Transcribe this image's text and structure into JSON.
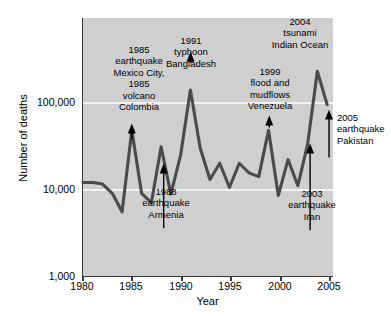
{
  "figure": {
    "background_color": "#ffffff",
    "plot_background_color": "#cfcfcf",
    "line_color": "#4a4a4a",
    "gridline_color": "#f2f2f2",
    "axis_color": "#3a3a3a"
  },
  "chart_data": {
    "type": "line",
    "title": "",
    "xlabel": "Year",
    "ylabel": "Number of deaths",
    "xlim": [
      1980,
      2005.6
    ],
    "ylim": [
      1000,
      1000000
    ],
    "yscale": "log",
    "grid": true,
    "legend": null,
    "xticks": [
      "1980",
      "1985",
      "1990",
      "1995",
      "2000",
      "2005"
    ],
    "xtick_values": [
      1980,
      1985,
      1990,
      1995,
      2000,
      2005
    ],
    "yticks": [
      "1,000",
      "10,000",
      "100,000"
    ],
    "ytick_values": [
      1000,
      10000,
      100000
    ],
    "x": [
      1980,
      1981,
      1982,
      1983,
      1984,
      1985,
      1986,
      1987,
      1988,
      1989,
      1990,
      1991,
      1992,
      1993,
      1994,
      1995,
      1996,
      1997,
      1998,
      1999,
      2000,
      2001,
      2002,
      2003,
      2004,
      2005
    ],
    "values": [
      12000,
      12000,
      11500,
      9000,
      5500,
      48000,
      9000,
      7000,
      31000,
      8800,
      25000,
      140000,
      30000,
      13000,
      20000,
      10500,
      20000,
      15500,
      14000,
      48000,
      8500,
      22000,
      11000,
      33000,
      230000,
      95000
    ],
    "annotations": [
      {
        "id": "mexico-colombia",
        "lines": [
          "1985",
          "earthquake",
          "Mexico City,",
          "1985",
          "volcano",
          "Colombia"
        ],
        "points_to_year": 1985
      },
      {
        "id": "bangladesh",
        "lines": [
          "1991",
          "typhoon",
          "Bangladesh"
        ],
        "points_to_year": 1991
      },
      {
        "id": "venezuela",
        "lines": [
          "1999",
          "flood and",
          "mudflows",
          "Venezuela"
        ],
        "points_to_year": 1999
      },
      {
        "id": "indian-ocean",
        "lines": [
          "2004",
          "tsunami",
          "Indian Ocean"
        ],
        "points_to_year": 2004
      },
      {
        "id": "armenia",
        "lines": [
          "1988",
          "earthquake",
          "Armenia"
        ],
        "points_to_year": 1988
      },
      {
        "id": "iran",
        "lines": [
          "2003",
          "earthquake",
          "Iran"
        ],
        "points_to_year": 2003
      },
      {
        "id": "pakistan",
        "lines": [
          "2005",
          "earthquake",
          "Pakistan"
        ],
        "points_to_year": 2005
      }
    ]
  },
  "axes": {
    "y_title": "Number of deaths",
    "x_title": "Year",
    "y_labels": [
      "100,000",
      "10,000",
      "1,000"
    ],
    "x_labels": [
      "1980",
      "1985",
      "1990",
      "1995",
      "2000",
      "2005"
    ]
  },
  "annotations": {
    "mexico_colombia": {
      "l1": "1985",
      "l2": "earthquake",
      "l3": "Mexico City,",
      "l4": "1985",
      "l5": "volcano",
      "l6": "Colombia"
    },
    "bangladesh": {
      "l1": "1991",
      "l2": "typhoon",
      "l3": "Bangladesh"
    },
    "venezuela": {
      "l1": "1999",
      "l2": "flood and",
      "l3": "mudflows",
      "l4": "Venezuela"
    },
    "indian_ocean": {
      "l1": "2004",
      "l2": "tsunami",
      "l3": "Indian Ocean"
    },
    "armenia": {
      "l1": "1988",
      "l2": "earthquake",
      "l3": "Armenia"
    },
    "iran": {
      "l1": "2003",
      "l2": "earthquake",
      "l3": "Iran"
    },
    "pakistan": {
      "l1": "2005",
      "l2": "earthquake",
      "l3": "Pakistan"
    }
  }
}
